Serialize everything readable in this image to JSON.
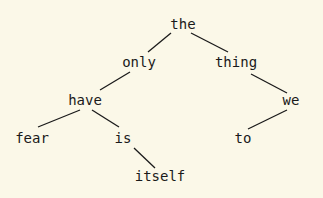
{
  "nodes": [
    {
      "id": "the",
      "label": "the"
    },
    {
      "id": "only",
      "label": "only"
    },
    {
      "id": "thing",
      "label": "thing"
    },
    {
      "id": "have",
      "label": "have"
    },
    {
      "id": "we",
      "label": "we"
    },
    {
      "id": "fear",
      "label": "fear"
    },
    {
      "id": "is",
      "label": "is"
    },
    {
      "id": "to",
      "label": "to"
    },
    {
      "id": "itself",
      "label": "itself"
    }
  ],
  "edges": [
    {
      "from": "the",
      "to": "only",
      "side": "left"
    },
    {
      "from": "the",
      "to": "thing",
      "side": "right"
    },
    {
      "from": "only",
      "to": "have",
      "side": "left"
    },
    {
      "from": "thing",
      "to": "we",
      "side": "right"
    },
    {
      "from": "have",
      "to": "fear",
      "side": "left"
    },
    {
      "from": "have",
      "to": "is",
      "side": "right"
    },
    {
      "from": "we",
      "to": "to",
      "side": "left"
    },
    {
      "from": "is",
      "to": "itself",
      "side": "right"
    }
  ]
}
